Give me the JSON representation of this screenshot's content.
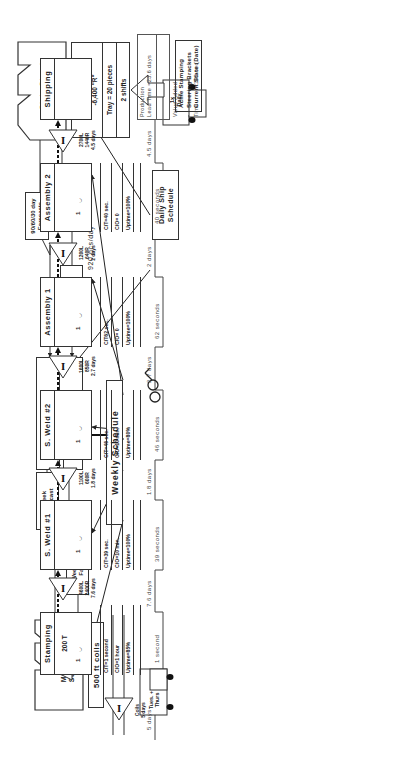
{
  "title": {
    "company": "Acme Stamping",
    "product": "Steering Brackets",
    "state": "Current State (Date)"
  },
  "customer": {
    "name_line1": "State Street",
    "name_line2": "Assembly",
    "demand_line1": "18,400 pcs/mo",
    "demand_line2": "-12,000 \"L\"",
    "demand_line3": "-6,400 \"R\"",
    "tray": "Tray = 20 pieces",
    "shifts": "2 shifts"
  },
  "supplier": {
    "name_line1": "Michigan",
    "name_line2": "Steel Co.",
    "material": "500 ft coils"
  },
  "production_control": {
    "label_line1": "Production",
    "label_line2": "Control",
    "system": "MRP"
  },
  "information_flows": {
    "customer_forecast_line1": "90/60/30 day",
    "customer_forecast_line2": "Forecasts",
    "daily_order_line1": "Daily",
    "daily_order_line2": "Order",
    "daily_rate": "920 pcs/day",
    "supplier_forecast_line1": "6-week",
    "supplier_forecast_line2": "Forecast",
    "weekly_fax_line1": "Weekly",
    "weekly_fax_line2": "Fax",
    "weekly_schedule": "Weekly Schedule",
    "daily_ship_schedule_line1": "Daily Ship",
    "daily_ship_schedule_line2": "Schedule"
  },
  "shipments": {
    "to_customer_line1": "1x",
    "to_customer_line2": "Daily",
    "from_supplier_line1": "Tues. +",
    "from_supplier_line2": "Thurs"
  },
  "raw_inventory": {
    "line1": "Coils",
    "line2": "5 days"
  },
  "processes": [
    {
      "name": "Stamping",
      "extra": "200 T",
      "operators": "1",
      "ct": "C/T=1 second",
      "co": "C/O=1 hour",
      "uptime": "Uptime=85%",
      "inv_line1": "4600L",
      "inv_line2": "2400R",
      "inv_line3": "7.6 days"
    },
    {
      "name": "S. Weld #1",
      "extra": "",
      "operators": "1",
      "ct": "C/T=39 sec.",
      "co": "C/O=10 min.",
      "uptime": "Uptime=100%",
      "inv_line1": "1100L",
      "inv_line2": "600R",
      "inv_line3": "1.8 days"
    },
    {
      "name": "S. Weld #2",
      "extra": "",
      "operators": "1",
      "ct": "C/T=46 sec.",
      "co": "C/O=10 min.",
      "uptime": "Uptime=80%",
      "inv_line1": "1600L",
      "inv_line2": "850R",
      "inv_line3": "2.7 days"
    },
    {
      "name": "Assembly 1",
      "extra": "",
      "operators": "1",
      "ct": "C/T62 sec.",
      "co": "C/O= 0",
      "uptime": "Uptime=100%",
      "inv_line1": "1200L",
      "inv_line2": "640R",
      "inv_line3": "2 days"
    },
    {
      "name": "Assembly 2",
      "extra": "",
      "operators": "1",
      "ct": "C/T=40 sec.",
      "co": "C/O= 0",
      "uptime": "Uptime=100%",
      "inv_line1": "2700L",
      "inv_line2": "1440R",
      "inv_line3": "4.5 days"
    },
    {
      "name": "Shipping",
      "extra": "",
      "operators": "",
      "ct": "",
      "co": "",
      "uptime": "",
      "inv_line1": "",
      "inv_line2": "",
      "inv_line3": ""
    }
  ],
  "timeline": {
    "wait_times": [
      "5 days",
      "7.6 days",
      "1.8 days",
      "2.7 days",
      "2 days",
      "4.5 days"
    ],
    "process_times": [
      "1 second",
      "39 seconds",
      "46 seconds",
      "62 seconds",
      "40 seconds"
    ],
    "summary": {
      "lead_time_label_line1": "Production",
      "lead_time_label_line2": "Lead Time =23.6 days",
      "value_added_label_line1": "Value Added",
      "value_added_label_line2": "Time        =188 sec."
    }
  },
  "icons": {
    "inventory": "I",
    "operator": "operator-icon",
    "go_see": "eyeglasses-icon",
    "truck": "truck-icon",
    "push_arrow": "push-arrow-icon",
    "electronic_info": "lightning-arrow-icon"
  }
}
